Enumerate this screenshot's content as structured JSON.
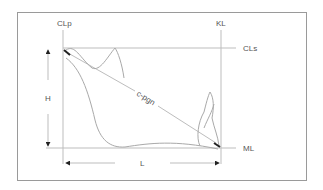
{
  "diagram": {
    "labels": {
      "clp": "CLp",
      "kl": "KL",
      "cls": "CLs",
      "ml": "ML",
      "h": "H",
      "l": "L",
      "cpgn": "c-pgn"
    },
    "colors": {
      "line": "#bdbdbd",
      "curve": "#a9a9a9",
      "arrow": "#222222",
      "frame": "#9a9a9a",
      "text": "#555555"
    }
  }
}
